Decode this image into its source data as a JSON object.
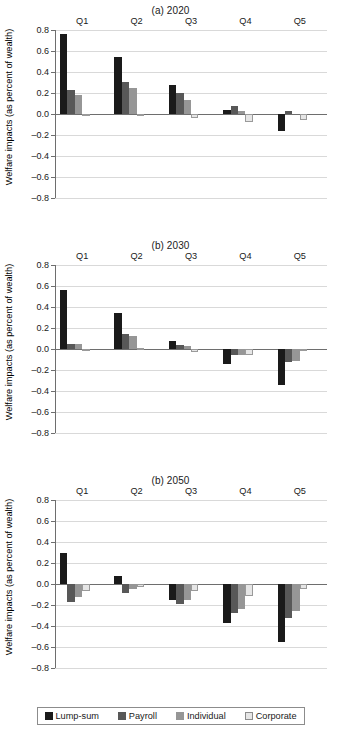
{
  "chart_data": [
    {
      "type": "bar",
      "title": "(a) 2020",
      "xlabel": "",
      "ylabel": "Welfare impacts (as percent of wealth)",
      "categories": [
        "Q1",
        "Q2",
        "Q3",
        "Q4",
        "Q5"
      ],
      "ylim": [
        -0.8,
        0.8
      ],
      "yticks": [
        "0.8",
        "0.6",
        "0.4",
        "0.2",
        "0.0",
        "–0.2",
        "–0.4",
        "–0.6",
        "–0.8"
      ],
      "grid": true,
      "legend_position": "bottom",
      "series": [
        {
          "name": "Lump-sum",
          "values": [
            0.76,
            0.545,
            0.28,
            0.04,
            -0.16
          ]
        },
        {
          "name": "Payroll",
          "values": [
            0.23,
            0.305,
            0.2,
            0.08,
            0.025
          ]
        },
        {
          "name": "Individual",
          "values": [
            0.18,
            0.25,
            0.135,
            0.03,
            0.0
          ]
        },
        {
          "name": "Corporate",
          "values": [
            -0.02,
            -0.012,
            -0.04,
            -0.08,
            -0.06
          ]
        }
      ]
    },
    {
      "type": "bar",
      "title": "(b) 2030",
      "xlabel": "",
      "ylabel": "Welfare impacts (as percent of wealth)",
      "categories": [
        "Q1",
        "Q2",
        "Q3",
        "Q4",
        "Q5"
      ],
      "ylim": [
        -0.8,
        0.8
      ],
      "yticks": [
        "0.8",
        "0.6",
        "0.4",
        "0.2",
        "0.0",
        "–0.2",
        "–0.4",
        "–0.6",
        "–0.8"
      ],
      "grid": true,
      "legend_position": "bottom",
      "series": [
        {
          "name": "Lump-sum",
          "values": [
            0.565,
            0.34,
            0.08,
            -0.14,
            -0.34
          ]
        },
        {
          "name": "Payroll",
          "values": [
            0.05,
            0.14,
            0.04,
            -0.06,
            -0.12
          ]
        },
        {
          "name": "Individual",
          "values": [
            0.05,
            0.125,
            0.025,
            -0.06,
            -0.11
          ]
        },
        {
          "name": "Corporate",
          "values": [
            -0.015,
            0.008,
            -0.03,
            -0.06,
            -0.02
          ]
        }
      ]
    },
    {
      "type": "bar",
      "title": "(b) 2050",
      "xlabel": "",
      "ylabel": "Welfare impacts (as percent of wealth)",
      "categories": [
        "Q1",
        "Q2",
        "Q3",
        "Q4",
        "Q5"
      ],
      "ylim": [
        -0.8,
        0.8
      ],
      "yticks": [
        "0.8",
        "0.6",
        "0.4",
        "0.2",
        "0.0",
        "–0.2",
        "–0.4",
        "–0.6",
        "–0.8"
      ],
      "grid": true,
      "legend_position": "bottom",
      "series": [
        {
          "name": "Lump-sum",
          "values": [
            0.3,
            0.08,
            -0.15,
            -0.37,
            -0.55
          ]
        },
        {
          "name": "Payroll",
          "values": [
            -0.17,
            -0.09,
            -0.19,
            -0.28,
            -0.32
          ]
        },
        {
          "name": "Individual",
          "values": [
            -0.12,
            -0.05,
            -0.15,
            -0.24,
            -0.26
          ]
        },
        {
          "name": "Corporate",
          "values": [
            -0.07,
            -0.025,
            -0.07,
            -0.11,
            -0.05
          ]
        }
      ]
    }
  ],
  "legend": {
    "items": [
      {
        "label": "Lump-sum",
        "color": "#1a1a1a"
      },
      {
        "label": "Payroll",
        "color": "#585858"
      },
      {
        "label": "Individual",
        "color": "#969696"
      },
      {
        "label": "Corporate",
        "color": "#e6e6e6"
      }
    ]
  }
}
